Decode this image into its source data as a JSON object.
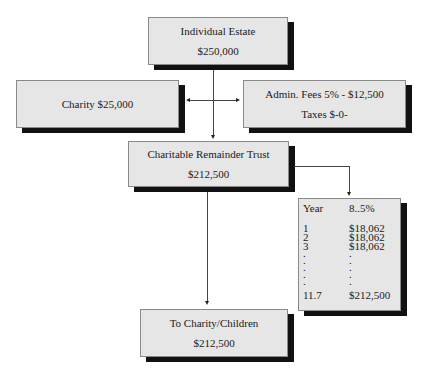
{
  "diagram": {
    "nodes": {
      "estate": {
        "title": "Individual Estate",
        "value": "$250,000"
      },
      "charity": {
        "title": "Charity $25,000"
      },
      "admin": {
        "line1": "Admin. Fees 5% - $12,500",
        "line2": "Taxes $-0-"
      },
      "crt": {
        "title": "Charitable Remainder Trust",
        "value": "$212,500"
      },
      "children": {
        "title": "To Charity/Children",
        "value": "$212,500"
      }
    },
    "payout_table": {
      "headers": [
        "Year",
        "8..5%"
      ],
      "rows": [
        [
          "1",
          "$18,062"
        ],
        [
          "2",
          "$18,062"
        ],
        [
          "3",
          "$18,062"
        ]
      ],
      "ellipsis": [
        ".",
        ".",
        ".",
        ".",
        "."
      ],
      "final_row": [
        "11.7",
        "$212,500"
      ]
    },
    "edges": [
      {
        "from": "estate",
        "to": "crt"
      },
      {
        "from": "estate",
        "to": "charity"
      },
      {
        "from": "estate",
        "to": "admin"
      },
      {
        "from": "crt",
        "to": "payout_table"
      },
      {
        "from": "crt",
        "to": "children"
      }
    ],
    "colors": {
      "box_fill": "#e6e6e6",
      "shadow": "#111111",
      "line": "#444444"
    }
  }
}
